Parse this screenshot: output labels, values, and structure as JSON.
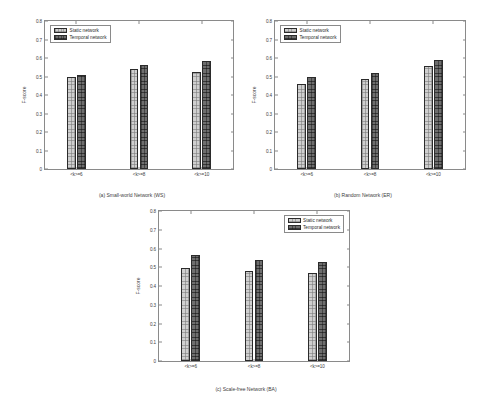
{
  "figure": {
    "background": "#ffffff",
    "axis_color": "#8a8a8a",
    "text_color": "#3d3d3d"
  },
  "legend": {
    "static_label": "Static network",
    "temporal_label": "Temporal network",
    "static_color": "#cfcfcf",
    "temporal_color": "#4b4b4b"
  },
  "axis": {
    "ylabel": "F-score",
    "yticks": [
      "0",
      "0.1",
      "0.2",
      "0.3",
      "0.4",
      "0.5",
      "0.6",
      "0.7",
      "0.8"
    ],
    "xticks": [
      "<k>=6",
      "<k>=8",
      "<k>=10"
    ]
  },
  "chart_data": [
    {
      "type": "bar",
      "title": "(a) Small-world Network (WS)",
      "categories": [
        "<k>=6",
        "<k>=8",
        "<k>=10"
      ],
      "series": [
        {
          "name": "Static network",
          "values": [
            0.497,
            0.543,
            0.522
          ]
        },
        {
          "name": "Temporal network",
          "values": [
            0.507,
            0.562,
            0.583
          ]
        }
      ],
      "xlabel": "",
      "ylabel": "F-score",
      "ylim": [
        0,
        0.8
      ],
      "ytick_step": 0.1,
      "grid": false,
      "legend_position": "top-left"
    },
    {
      "type": "bar",
      "title": "(b) Random Network (ER)",
      "categories": [
        "<k>=6",
        "<k>=8",
        "<k>=10"
      ],
      "series": [
        {
          "name": "Static network",
          "values": [
            0.459,
            0.489,
            0.557
          ]
        },
        {
          "name": "Temporal network",
          "values": [
            0.497,
            0.517,
            0.588
          ]
        }
      ],
      "xlabel": "",
      "ylabel": "F-score",
      "ylim": [
        0,
        0.8
      ],
      "ytick_step": 0.1,
      "grid": false,
      "legend_position": "top-left"
    },
    {
      "type": "bar",
      "title": "(c) Scale-free Network (BA)",
      "categories": [
        "<k>=6",
        "<k>=8",
        "<k>=10"
      ],
      "series": [
        {
          "name": "Static network",
          "values": [
            0.498,
            0.479,
            0.467
          ]
        },
        {
          "name": "Temporal network",
          "values": [
            0.568,
            0.537,
            0.527
          ]
        }
      ],
      "xlabel": "",
      "ylabel": "F-score",
      "ylim": [
        0,
        0.8
      ],
      "ytick_step": 0.1,
      "grid": false,
      "legend_position": "top-right"
    }
  ]
}
